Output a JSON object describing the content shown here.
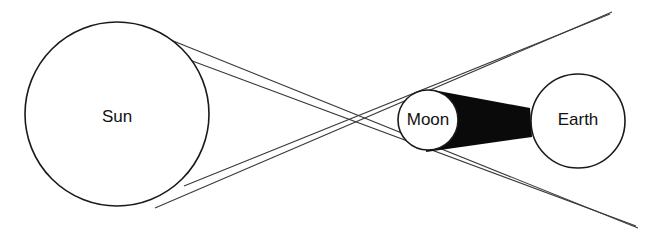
{
  "diagram": {
    "background_color": "#ffffff",
    "line_color": "#3a3a3a",
    "outline_color": "#1a1a1a",
    "umbra_color": "#0a0a0a",
    "label_color": "#111111"
  },
  "bodies": {
    "sun": {
      "label": "Sun",
      "cx": 117,
      "cy": 114,
      "r": 92,
      "stroke_width": 1.6,
      "label_x": 117,
      "label_y": 118
    },
    "moon": {
      "label": "Moon",
      "cx": 428,
      "cy": 120,
      "r": 30,
      "stroke_width": 1.6,
      "label_x": 428,
      "label_y": 121
    },
    "earth": {
      "label": "Earth",
      "cx": 578,
      "cy": 121,
      "r": 47,
      "stroke_width": 1.6,
      "label_x": 578,
      "label_y": 121
    }
  },
  "umbra": {
    "name": "umbra-shadow-cone",
    "points": "433,90 530,108 532,137 426,152"
  },
  "rays": [
    {
      "name": "ray-sun-top-to-lower-right",
      "x1": 146,
      "y1": 30,
      "x2": 638,
      "y2": 228,
      "stroke_width": 1.1
    },
    {
      "name": "ray-sun-upper-tangent-to-moon-bottom",
      "x1": 160,
      "y1": 49,
      "x2": 636,
      "y2": 226,
      "stroke_width": 1.1
    },
    {
      "name": "ray-sun-lower-to-upper-right",
      "x1": 155,
      "y1": 208,
      "x2": 612,
      "y2": 12,
      "stroke_width": 1.1
    },
    {
      "name": "ray-sun-lower-tangent-to-moon-top",
      "x1": 184,
      "y1": 186,
      "x2": 610,
      "y2": 14,
      "stroke_width": 1.1
    }
  ]
}
